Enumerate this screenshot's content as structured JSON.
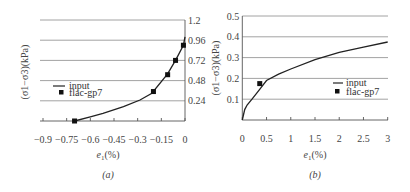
{
  "chart_data": [
    {
      "panel": "a",
      "type": "line",
      "caption": "(a)",
      "xlabel": "e1(%)",
      "ylabel": "(σ1−σ3)(kPa)",
      "xlim": [
        -0.9,
        0
      ],
      "ylim": [
        0,
        1.2
      ],
      "xticks": [
        "-0.9",
        "-0.75",
        "-0.6",
        "-0.45",
        "-0.3",
        "-0.15",
        "0"
      ],
      "yticks": [
        "0.24",
        "0.48",
        "0.72",
        "0.96",
        "1.2"
      ],
      "y_axis_position": "right",
      "grid": "horizontal",
      "legend": {
        "position": "center-left",
        "entries": [
          "input",
          "flac-gp7"
        ]
      },
      "series": [
        {
          "name": "input",
          "style": "line",
          "x": [
            -0.7,
            -0.6,
            -0.52,
            -0.39,
            -0.285,
            -0.21,
            -0.11,
            -0.06,
            -0.01,
            0.0
          ],
          "y": [
            0.0,
            0.05,
            0.09,
            0.17,
            0.25,
            0.33,
            0.56,
            0.72,
            0.9,
            1.0
          ]
        },
        {
          "name": "flac-gp7",
          "style": "marker-square",
          "x": [
            -0.7,
            -0.2,
            -0.11,
            -0.06,
            -0.01
          ],
          "y": [
            0.0,
            0.35,
            0.55,
            0.72,
            0.9
          ]
        }
      ]
    },
    {
      "panel": "b",
      "type": "line",
      "caption": "(b)",
      "xlabel": "e1(%)",
      "ylabel": "(σ1−σ3)(kPa)",
      "xlim": [
        0,
        3
      ],
      "ylim": [
        0,
        0.5
      ],
      "xticks": [
        "0",
        "0.5",
        "1",
        "1.5",
        "2",
        "2.5",
        "3"
      ],
      "yticks": [
        "0.1",
        "0.2",
        "0.3",
        "0.4",
        "0.5"
      ],
      "y_axis_position": "left",
      "grid": "horizontal",
      "legend": {
        "position": "center-right",
        "entries": [
          "input",
          "flac-gp7"
        ]
      },
      "series": [
        {
          "name": "input",
          "style": "line",
          "x": [
            0,
            0.05,
            0.1,
            0.2,
            0.35,
            0.5,
            0.75,
            1.0,
            1.5,
            2.0,
            2.5,
            3.0
          ],
          "y": [
            0,
            0.05,
            0.072,
            0.1,
            0.145,
            0.19,
            0.22,
            0.245,
            0.29,
            0.325,
            0.35,
            0.375
          ]
        },
        {
          "name": "flac-gp7",
          "style": "marker-square",
          "x": [
            0.36
          ],
          "y": [
            0.175
          ]
        }
      ]
    }
  ],
  "panels": {
    "a": {
      "caption": "(a)",
      "xlabel_main": "e",
      "xlabel_sub": "1",
      "xlabel_unit": "(%)",
      "ylabel": "(σ1−σ3)(kPa)",
      "legend_line": "input",
      "legend_marker": "flac-gp7"
    },
    "b": {
      "caption": "(b)",
      "xlabel_main": "e",
      "xlabel_sub": "1",
      "xlabel_unit": "(%)",
      "ylabel": "(σ1−σ3)(kPa)",
      "legend_line": "input",
      "legend_marker": "flac-gp7"
    }
  }
}
